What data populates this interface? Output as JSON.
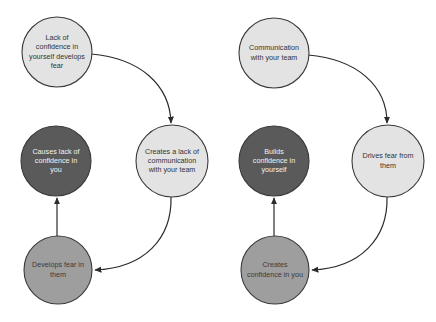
{
  "diagram": {
    "type": "two-cycle-flow-diagram",
    "background_color": "#ffffff",
    "palette": {
      "light": "#e3e3e3",
      "medium": "#9e9e9e",
      "dark": "#5a5a5a",
      "outline": "#3a3a3a",
      "arrow": "#2b2b2b",
      "text_on_light": "#333333",
      "text_on_dark": "#f2f2f2"
    },
    "cycles": [
      {
        "id": "negative-cycle",
        "nodes": [
          {
            "id": "lack-of-confidence",
            "lines": [
              "Lack of",
              "confidence in",
              "yourself develops",
              "fear"
            ],
            "shade": "light",
            "cx": 57,
            "cy": 52,
            "r": 35
          },
          {
            "id": "creates-lack-of-communication",
            "lines": [
              "Creates a lack of",
              "communication",
              "with your team"
            ],
            "shade": "light",
            "cx": 172,
            "cy": 161,
            "r": 36
          },
          {
            "id": "develops-fear-in-them",
            "lines": [
              "Develops fear in",
              "them"
            ],
            "shade": "medium",
            "cx": 58,
            "cy": 270,
            "r": 34
          },
          {
            "id": "causes-lack-of-confidence",
            "lines": [
              "Causes lack of",
              "confidence in",
              "you"
            ],
            "shade": "dark",
            "cx": 56,
            "cy": 161,
            "r": 35
          }
        ],
        "edges": [
          {
            "id": "edge-confidence-to-communication",
            "from": "lack-of-confidence",
            "to": "creates-lack-of-communication",
            "path": "M 91 54 C 140 58 170 85 171 123"
          },
          {
            "id": "edge-communication-to-fear",
            "from": "creates-lack-of-communication",
            "to": "develops-fear-in-them",
            "path": "M 171 197 C 172 238 145 268 95 270"
          },
          {
            "id": "edge-fear-to-causes",
            "from": "develops-fear-in-them",
            "to": "causes-lack-of-confidence",
            "path": "M 57 236 L 57 198"
          }
        ]
      },
      {
        "id": "positive-cycle",
        "nodes": [
          {
            "id": "communication-with-team",
            "lines": [
              "Communication",
              "with your team"
            ],
            "shade": "light",
            "cx": 274,
            "cy": 53,
            "r": 35
          },
          {
            "id": "drives-fear-from-them",
            "lines": [
              "Drives fear from",
              "them"
            ],
            "shade": "light",
            "cx": 388,
            "cy": 161,
            "r": 36
          },
          {
            "id": "creates-confidence-in-you",
            "lines": [
              "Creates",
              "confidence in you"
            ],
            "shade": "medium",
            "cx": 275,
            "cy": 270,
            "r": 34
          },
          {
            "id": "builds-confidence-in-yourself",
            "lines": [
              "Builds",
              "confidence in",
              "yourself"
            ],
            "shade": "dark",
            "cx": 274,
            "cy": 161,
            "r": 35
          }
        ],
        "edges": [
          {
            "id": "edge-communication-to-drives-fear",
            "from": "communication-with-team",
            "to": "drives-fear-from-them",
            "path": "M 308 55 C 357 59 387 86 387 123"
          },
          {
            "id": "edge-drives-fear-to-creates-confidence",
            "from": "drives-fear-from-them",
            "to": "creates-confidence-in-you",
            "path": "M 387 197 C 388 238 361 268 312 270"
          },
          {
            "id": "edge-creates-to-builds",
            "from": "creates-confidence-in-you",
            "to": "builds-confidence-in-yourself",
            "path": "M 274 236 L 274 198"
          }
        ]
      }
    ]
  }
}
